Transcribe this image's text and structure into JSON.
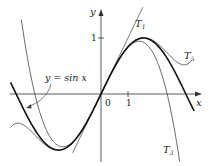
{
  "chart_data": {
    "type": "line",
    "title": "",
    "xlabel": "x",
    "ylabel": "y",
    "origin_label": "0",
    "x_ticks": [
      {
        "value": 1,
        "label": "1"
      }
    ],
    "y_ticks": [
      {
        "value": 1,
        "label": "1"
      }
    ],
    "xlim": [
      -3.4,
      3.7
    ],
    "ylim": [
      -1.3,
      1.65
    ],
    "grid": false,
    "series": [
      {
        "name": "y = sin x",
        "expr": "sin(x)",
        "domain": [
          -3.35,
          3.45
        ],
        "weight": "bold"
      },
      {
        "name": "T1",
        "expr": "x",
        "domain": [
          -1.05,
          1.55
        ],
        "weight": "thin"
      },
      {
        "name": "T3",
        "expr": "x - x^3/6",
        "domain": [
          -2.95,
          2.95
        ],
        "weight": "thin"
      },
      {
        "name": "T5",
        "expr": "x - x^3/6 + x^5/120",
        "domain": [
          -3.35,
          3.35
        ],
        "weight": "thin"
      }
    ],
    "annotations": [
      {
        "text": "y = sin x",
        "points_to": "sin curve near x=-3"
      },
      {
        "text": "T1"
      },
      {
        "text": "T3"
      },
      {
        "text": "T5"
      }
    ]
  },
  "labels": {
    "y_axis": "y",
    "x_axis": "x",
    "origin": "0",
    "x_tick_1": "1",
    "y_tick_1": "1",
    "sin_label": "y = sin x",
    "t1": "T",
    "t1_sub": "1",
    "t3": "T",
    "t3_sub": "3",
    "t5": "T",
    "t5_sub": "5"
  }
}
